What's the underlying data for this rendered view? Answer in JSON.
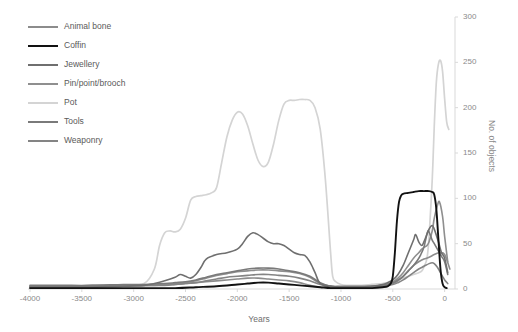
{
  "chart_data": {
    "type": "line",
    "title": "",
    "xlabel": "Years",
    "ylabel": "No. of objects",
    "xlim": [
      -4000,
      100
    ],
    "ylim": [
      0,
      300
    ],
    "grid": false,
    "legend_position": "top-left",
    "y_axis_side": "right",
    "xticks": [
      "-4000",
      "-3500",
      "-3000",
      "-2500",
      "-2000",
      "-1500",
      "-1000",
      "-500",
      "0"
    ],
    "xtick_values": [
      -4000,
      -3500,
      -3000,
      -2500,
      -2000,
      -1500,
      -1000,
      -500,
      0
    ],
    "yticks": [
      "0",
      "50",
      "100",
      "150",
      "200",
      "250",
      "300"
    ],
    "ytick_values": [
      0,
      50,
      100,
      150,
      200,
      250,
      300
    ],
    "series": [
      {
        "name": "Animal bone",
        "color": "#8c8c8c",
        "width": 1.6,
        "x": [
          -4000,
          -3800,
          -3600,
          -3400,
          -3200,
          -3000,
          -2800,
          -2600,
          -2500,
          -2400,
          -2300,
          -2200,
          -2100,
          -2000,
          -1900,
          -1800,
          -1700,
          -1600,
          -1500,
          -1400,
          -1300,
          -1200,
          -1100,
          -1000,
          -900,
          -800,
          -700,
          -600,
          -500,
          -450,
          -400,
          -350,
          -300,
          -250,
          -200,
          -150,
          -100,
          -50,
          0,
          50
        ],
        "values": [
          3,
          3,
          3,
          4,
          4,
          4,
          4,
          5,
          6,
          7,
          8,
          9,
          10,
          11,
          12,
          12,
          11,
          10,
          9,
          7,
          4,
          2,
          2,
          2,
          2,
          2,
          3,
          4,
          6,
          9,
          14,
          20,
          26,
          30,
          33,
          35,
          38,
          40,
          38,
          22
        ]
      },
      {
        "name": "Coffin",
        "color": "#121212",
        "width": 1.9,
        "x": [
          -4000,
          -3500,
          -3000,
          -2600,
          -2400,
          -2200,
          -2000,
          -1900,
          -1800,
          -1700,
          -1600,
          -1500,
          -1400,
          -1300,
          -1200,
          -1100,
          -1000,
          -900,
          -800,
          -700,
          -600,
          -550,
          -520,
          -500,
          -480,
          -460,
          -440,
          -420,
          -400,
          -350,
          -300,
          -250,
          -200,
          -150,
          -120,
          -100,
          -80,
          -60,
          -40,
          -20,
          0,
          20
        ],
        "values": [
          1,
          1,
          1,
          1,
          2,
          3,
          5,
          6,
          7,
          7,
          6,
          5,
          4,
          3,
          2,
          1,
          1,
          1,
          1,
          1,
          2,
          3,
          6,
          14,
          40,
          75,
          96,
          103,
          105,
          106,
          107,
          108,
          108,
          108,
          107,
          104,
          88,
          55,
          22,
          6,
          2,
          1
        ]
      },
      {
        "name": "Jewellery",
        "color": "#6f6f6f",
        "width": 1.6,
        "x": [
          -4000,
          -3700,
          -3400,
          -3100,
          -2900,
          -2800,
          -2700,
          -2600,
          -2550,
          -2500,
          -2450,
          -2400,
          -2350,
          -2300,
          -2200,
          -2100,
          -2000,
          -1950,
          -1900,
          -1850,
          -1800,
          -1750,
          -1700,
          -1650,
          -1600,
          -1550,
          -1500,
          -1450,
          -1400,
          -1350,
          -1300,
          -1250,
          -1200,
          -1100,
          -1000,
          -900,
          -800,
          -700,
          -600,
          -550,
          -500,
          -450,
          -400,
          -350,
          -300,
          -280,
          -250,
          -220,
          -200,
          -150,
          -120,
          -100,
          -60,
          -30,
          0,
          30
        ],
        "values": [
          2,
          2,
          2,
          3,
          4,
          6,
          9,
          13,
          16,
          14,
          12,
          16,
          24,
          33,
          38,
          40,
          44,
          50,
          58,
          62,
          60,
          56,
          52,
          50,
          50,
          48,
          44,
          40,
          38,
          37,
          30,
          18,
          6,
          3,
          2,
          2,
          2,
          3,
          5,
          7,
          10,
          16,
          26,
          40,
          54,
          60,
          52,
          48,
          52,
          66,
          70,
          66,
          52,
          40,
          34,
          18
        ]
      },
      {
        "name": "Pin/point/brooch",
        "color": "#8f8f8f",
        "width": 1.6,
        "x": [
          -4000,
          -3700,
          -3400,
          -3100,
          -2900,
          -2700,
          -2600,
          -2500,
          -2400,
          -2300,
          -2200,
          -2100,
          -2000,
          -1900,
          -1800,
          -1700,
          -1600,
          -1500,
          -1400,
          -1300,
          -1200,
          -1100,
          -1000,
          -900,
          -800,
          -700,
          -600,
          -500,
          -450,
          -400,
          -350,
          -300,
          -250,
          -220,
          -200,
          -170,
          -150,
          -120,
          -100,
          -70,
          -50,
          -20,
          0,
          30
        ],
        "values": [
          3,
          3,
          3,
          4,
          4,
          5,
          6,
          7,
          9,
          12,
          15,
          17,
          19,
          20,
          21,
          21,
          20,
          19,
          17,
          13,
          6,
          3,
          2,
          2,
          2,
          3,
          4,
          8,
          12,
          18,
          26,
          34,
          40,
          44,
          46,
          48,
          52,
          64,
          78,
          92,
          96,
          80,
          58,
          30
        ]
      },
      {
        "name": "Pot",
        "color": "#d4d4d4",
        "width": 1.7,
        "x": [
          -4000,
          -3700,
          -3400,
          -3100,
          -2900,
          -2800,
          -2750,
          -2700,
          -2650,
          -2600,
          -2550,
          -2500,
          -2450,
          -2400,
          -2350,
          -2300,
          -2250,
          -2200,
          -2150,
          -2100,
          -2050,
          -2000,
          -1950,
          -1900,
          -1850,
          -1800,
          -1750,
          -1700,
          -1650,
          -1600,
          -1550,
          -1500,
          -1450,
          -1400,
          -1350,
          -1300,
          -1250,
          -1200,
          -1150,
          -1100,
          -1080,
          -1050,
          -1000,
          -950,
          -900,
          -800,
          -700,
          -600,
          -550,
          -500,
          -450,
          -400,
          -350,
          -300,
          -250,
          -220,
          -200,
          -170,
          -150,
          -120,
          -100,
          -80,
          -60,
          -40,
          -20,
          0,
          20,
          40
        ],
        "values": [
          2,
          2,
          3,
          4,
          6,
          22,
          48,
          62,
          64,
          63,
          66,
          78,
          98,
          102,
          103,
          104,
          106,
          112,
          140,
          168,
          186,
          195,
          193,
          180,
          160,
          142,
          135,
          140,
          160,
          186,
          204,
          208,
          208,
          209,
          209,
          208,
          200,
          176,
          120,
          40,
          14,
          8,
          5,
          4,
          4,
          4,
          5,
          6,
          7,
          8,
          10,
          12,
          14,
          16,
          18,
          20,
          24,
          34,
          58,
          120,
          180,
          228,
          248,
          252,
          240,
          210,
          184,
          176
        ]
      },
      {
        "name": "Tools",
        "color": "#7a7a7a",
        "width": 1.6,
        "x": [
          -4000,
          -3700,
          -3400,
          -3100,
          -2900,
          -2700,
          -2600,
          -2500,
          -2400,
          -2300,
          -2200,
          -2100,
          -2000,
          -1900,
          -1800,
          -1700,
          -1600,
          -1500,
          -1400,
          -1300,
          -1200,
          -1100,
          -1000,
          -900,
          -800,
          -700,
          -600,
          -500,
          -450,
          -400,
          -350,
          -300,
          -260,
          -230,
          -200,
          -180,
          -160,
          -140,
          -120,
          -100,
          -60,
          -30,
          0,
          30
        ],
        "values": [
          4,
          4,
          4,
          5,
          5,
          6,
          7,
          8,
          10,
          13,
          16,
          18,
          20,
          22,
          23,
          23,
          22,
          20,
          18,
          14,
          7,
          3,
          3,
          3,
          3,
          3,
          4,
          7,
          10,
          14,
          20,
          26,
          32,
          38,
          46,
          56,
          64,
          60,
          54,
          50,
          42,
          36,
          30,
          16
        ]
      },
      {
        "name": "Weaponry",
        "color": "#848484",
        "width": 1.6,
        "x": [
          -4000,
          -3700,
          -3400,
          -3100,
          -2900,
          -2700,
          -2600,
          -2500,
          -2400,
          -2300,
          -2200,
          -2100,
          -2000,
          -1900,
          -1800,
          -1700,
          -1600,
          -1500,
          -1400,
          -1300,
          -1200,
          -1100,
          -1000,
          -900,
          -800,
          -700,
          -600,
          -500,
          -450,
          -400,
          -350,
          -300,
          -250,
          -200,
          -150,
          -120,
          -100,
          -70,
          -50,
          -20,
          0,
          30
        ],
        "values": [
          3,
          3,
          3,
          3,
          4,
          4,
          5,
          6,
          7,
          9,
          11,
          13,
          14,
          15,
          16,
          16,
          15,
          14,
          12,
          9,
          5,
          3,
          2,
          2,
          2,
          2,
          3,
          5,
          7,
          10,
          14,
          18,
          22,
          25,
          28,
          29,
          28,
          24,
          20,
          14,
          10,
          6
        ]
      }
    ]
  },
  "legend": {
    "items": [
      {
        "label": "Animal bone",
        "color": "#8c8c8c"
      },
      {
        "label": "Coffin",
        "color": "#121212"
      },
      {
        "label": "Jewellery",
        "color": "#6f6f6f"
      },
      {
        "label": "Pin/point/brooch",
        "color": "#8f8f8f"
      },
      {
        "label": "Pot",
        "color": "#d4d4d4"
      },
      {
        "label": "Tools",
        "color": "#7a7a7a"
      },
      {
        "label": "Weaponry",
        "color": "#848484"
      }
    ]
  },
  "axes": {
    "x_title": "Years",
    "y_title": "No. of objects"
  }
}
